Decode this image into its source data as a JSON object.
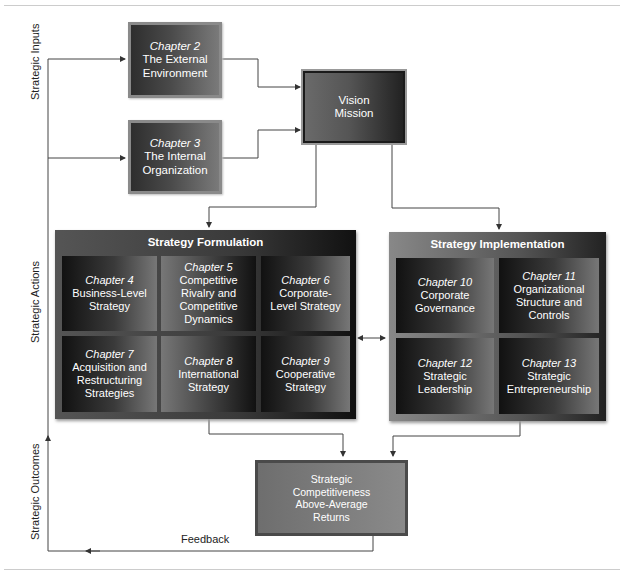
{
  "side_labels": {
    "inputs": "Strategic Inputs",
    "actions": "Strategic Actions",
    "outcomes": "Strategic Outcomes"
  },
  "feedback_label": "Feedback",
  "inputs": [
    {
      "chapter": "Chapter 2",
      "line1": "The External",
      "line2": "Environment"
    },
    {
      "chapter": "Chapter 3",
      "line1": "The Internal",
      "line2": "Organization"
    }
  ],
  "vision": {
    "line1": "Vision",
    "line2": "Mission"
  },
  "formulation": {
    "title": "Strategy Formulation",
    "cells": [
      {
        "chapter": "Chapter 4",
        "lines": [
          "Business-Level",
          "Strategy"
        ]
      },
      {
        "chapter": "Chapter 5",
        "lines": [
          "Competitive",
          "Rivalry and",
          "Competitive",
          "Dynamics"
        ]
      },
      {
        "chapter": "Chapter 6",
        "lines": [
          "Corporate-",
          "Level Strategy"
        ]
      },
      {
        "chapter": "Chapter 7",
        "lines": [
          "Acquisition and",
          "Restructuring",
          "Strategies"
        ]
      },
      {
        "chapter": "Chapter 8",
        "lines": [
          "International",
          "Strategy"
        ]
      },
      {
        "chapter": "Chapter 9",
        "lines": [
          "Cooperative",
          "Strategy"
        ]
      }
    ]
  },
  "implementation": {
    "title": "Strategy Implementation",
    "cells": [
      {
        "chapter": "Chapter 10",
        "lines": [
          "Corporate",
          "Governance"
        ]
      },
      {
        "chapter": "Chapter 11",
        "lines": [
          "Organizational",
          "Structure and",
          "Controls"
        ]
      },
      {
        "chapter": "Chapter 12",
        "lines": [
          "Strategic",
          "Leadership"
        ]
      },
      {
        "chapter": "Chapter 13",
        "lines": [
          "Strategic",
          "Entrepreneurship"
        ]
      }
    ]
  },
  "outcome": {
    "lines": [
      "Strategic",
      "Competitiveness",
      "Above-Average",
      "Returns"
    ]
  }
}
